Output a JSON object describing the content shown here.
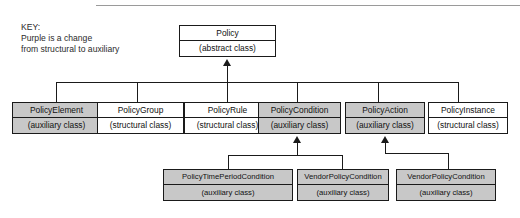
{
  "legend": {
    "title": "KEY:",
    "line1": "Purple is a change",
    "line2": "from structural to auxiliary"
  },
  "stereotypes": {
    "abstract": "(abstract class)",
    "auxiliary": "(auxiliary class)",
    "structural": "(structural class)"
  },
  "colors": {
    "auxiliary_fill": "#c8c8c8",
    "structural_fill": "#ffffff",
    "line": "#1a1a1a"
  },
  "root": {
    "name": "Policy",
    "stereotype": "(abstract class)",
    "kind": "abstract"
  },
  "level2": [
    {
      "name": "PolicyElement",
      "stereotype": "(auxiliary class)",
      "kind": "auxiliary"
    },
    {
      "name": "PolicyGroup",
      "stereotype": "(structural class)",
      "kind": "structural"
    },
    {
      "name": "PolicyRule",
      "stereotype": "(structural class)",
      "kind": "structural"
    },
    {
      "name": "PolicyCondition",
      "stereotype": "(auxiliary class)",
      "kind": "auxiliary"
    },
    {
      "name": "PolicyAction",
      "stereotype": "(auxiliary class)",
      "kind": "auxiliary"
    },
    {
      "name": "PolicyInstance",
      "stereotype": "(structural class)",
      "kind": "structural"
    }
  ],
  "level3": [
    {
      "name": "PolicyTimePeriodCondition",
      "stereotype": "(auxiliary class)",
      "kind": "auxiliary",
      "parent": "PolicyCondition"
    },
    {
      "name": "VendorPolicyCondition",
      "stereotype": "(auxiliary class)",
      "kind": "auxiliary",
      "parent": "PolicyCondition"
    },
    {
      "name": "VendorPolicyCondition",
      "stereotype": "(auxiliary class)",
      "kind": "auxiliary",
      "parent": "PolicyAction"
    }
  ]
}
